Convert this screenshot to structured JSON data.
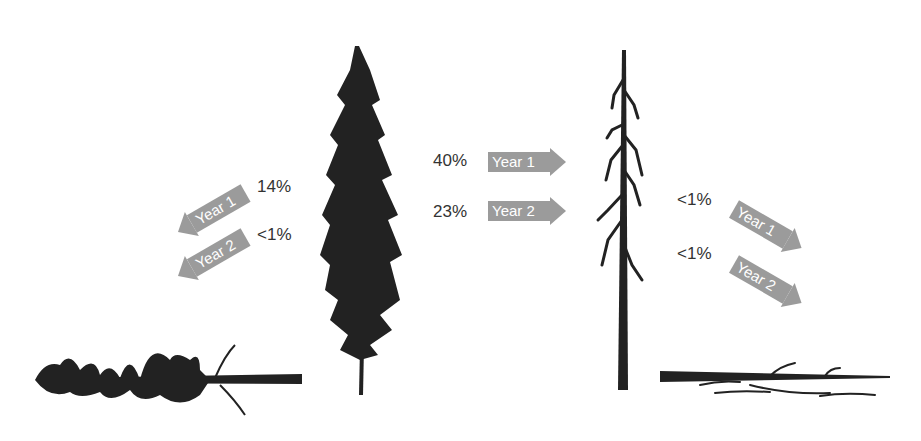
{
  "diagram": {
    "colors": {
      "arrow": "#9b9b9b",
      "tree": "#222222",
      "text": "#333333"
    },
    "center_to_snag": [
      {
        "percent": "40%",
        "label": "Year 1"
      },
      {
        "percent": "23%",
        "label": "Year 2"
      }
    ],
    "live_to_down": [
      {
        "percent": "14%",
        "label": "Year 1"
      },
      {
        "percent": "<1%",
        "label": "Year 2"
      }
    ],
    "snag_to_down": [
      {
        "percent": "<1%",
        "label": "Year 1"
      },
      {
        "percent": "<1%",
        "label": "Year 2"
      }
    ],
    "icons": [
      "live-tree-icon",
      "snag-tree-icon",
      "fallen-live-tree-icon",
      "fallen-snag-icon"
    ]
  }
}
